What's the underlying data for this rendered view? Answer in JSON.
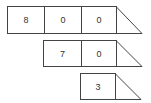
{
  "diagram": {
    "rows": [
      {
        "cells": [
          "8",
          "0",
          "0"
        ]
      },
      {
        "cells": [
          "7",
          "0"
        ]
      },
      {
        "cells": [
          "3"
        ]
      }
    ],
    "line_color": "#444444"
  }
}
